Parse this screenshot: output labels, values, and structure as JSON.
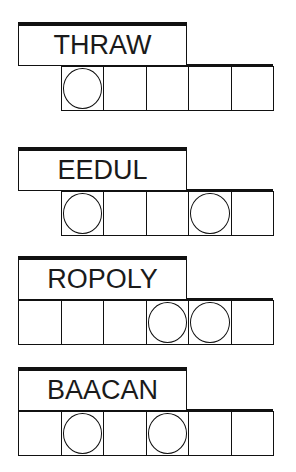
{
  "puzzles": [
    {
      "scrambled": "THRAW",
      "cells": [
        false,
        true,
        true,
        true,
        true,
        true
      ],
      "circles": [
        false,
        true,
        false,
        false,
        false,
        false
      ],
      "top": 22
    },
    {
      "scrambled": "EEDUL",
      "cells": [
        false,
        true,
        true,
        true,
        true,
        true
      ],
      "circles": [
        false,
        true,
        false,
        false,
        true,
        false
      ],
      "top": 147
    },
    {
      "scrambled": "ROPOLY",
      "cells": [
        true,
        true,
        true,
        true,
        true,
        true
      ],
      "circles": [
        false,
        false,
        false,
        true,
        true,
        false
      ],
      "top": 256
    },
    {
      "scrambled": "BAACAN",
      "cells": [
        true,
        true,
        true,
        true,
        true,
        true
      ],
      "circles": [
        false,
        true,
        false,
        true,
        false,
        false
      ],
      "top": 367
    }
  ]
}
